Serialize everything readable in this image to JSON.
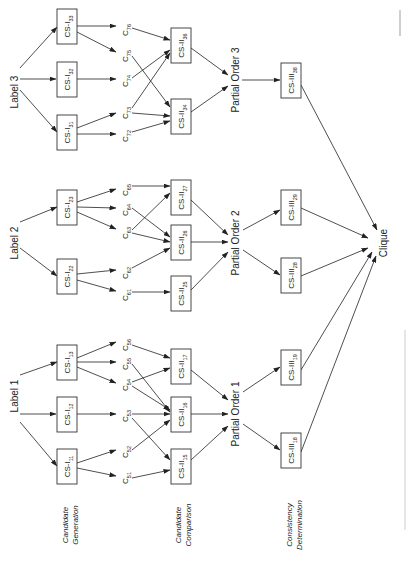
{
  "labels": {
    "label3": "Label 3",
    "label2": "Label 2",
    "label1": "Label 1"
  },
  "stages": {
    "candidate_generation": [
      "Candidate",
      "Generation"
    ],
    "candidate_comparison": [
      "Candidate",
      "Comparison"
    ],
    "consistency_determination": [
      "Consistency",
      "Determination"
    ]
  },
  "cs1": [
    {
      "id": "CS-I33",
      "base": "CS-I",
      "sub": "33"
    },
    {
      "id": "CS-I32",
      "base": "CS-I",
      "sub": "32"
    },
    {
      "id": "CS-I31",
      "base": "CS-I",
      "sub": "31"
    },
    {
      "id": "CS-I23",
      "base": "CS-I",
      "sub": "23"
    },
    {
      "id": "CS-I22",
      "base": "CS-I",
      "sub": "22"
    },
    {
      "id": "CS-I13",
      "base": "CS-I",
      "sub": "13"
    },
    {
      "id": "CS-I12",
      "base": "CS-I",
      "sub": "12"
    },
    {
      "id": "CS-I11",
      "base": "CS-I",
      "sub": "11"
    }
  ],
  "candidates": [
    {
      "base": "C",
      "sub": "76"
    },
    {
      "base": "C",
      "sub": "75"
    },
    {
      "base": "C",
      "sub": "74"
    },
    {
      "base": "C",
      "sub": "73"
    },
    {
      "base": "C",
      "sub": "72"
    },
    {
      "base": "C",
      "sub": "65"
    },
    {
      "base": "C",
      "sub": "64"
    },
    {
      "base": "C",
      "sub": "63"
    },
    {
      "base": "C",
      "sub": "62"
    },
    {
      "base": "C",
      "sub": "61"
    },
    {
      "base": "C",
      "sub": "56"
    },
    {
      "base": "C",
      "sub": "55"
    },
    {
      "base": "C",
      "sub": "54"
    },
    {
      "base": "C",
      "sub": "53"
    },
    {
      "base": "C",
      "sub": "52"
    },
    {
      "base": "C",
      "sub": "51"
    }
  ],
  "cs2": [
    {
      "base": "CS-II",
      "sub": "36"
    },
    {
      "base": "CS-II",
      "sub": "34"
    },
    {
      "base": "CS-II",
      "sub": "27"
    },
    {
      "base": "CS-II",
      "sub": "26"
    },
    {
      "base": "CS-II",
      "sub": "25"
    },
    {
      "base": "CS-II",
      "sub": "17"
    },
    {
      "base": "CS-II",
      "sub": "16"
    },
    {
      "base": "CS-II",
      "sub": "15"
    }
  ],
  "partial_orders": [
    "Partial Order 3",
    "Partial Order 2",
    "Partial Order 1"
  ],
  "cs3": [
    {
      "base": "CS-III",
      "sub": "38"
    },
    {
      "base": "CS-III",
      "sub": "29"
    },
    {
      "base": "CS-III",
      "sub": "28"
    },
    {
      "base": "CS-III",
      "sub": "19"
    },
    {
      "base": "CS-III",
      "sub": "18"
    }
  ],
  "clique": "Clique"
}
